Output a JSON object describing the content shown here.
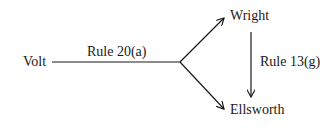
{
  "diagram": {
    "nodes": {
      "source": "Volt",
      "upper": "Wright",
      "lower": "Ellsworth"
    },
    "edges": {
      "main": "Rule 20(a)",
      "vertical": "Rule 13(g)"
    },
    "colors": {
      "ink": "#1a1a1a",
      "background": "#ffffff"
    }
  }
}
